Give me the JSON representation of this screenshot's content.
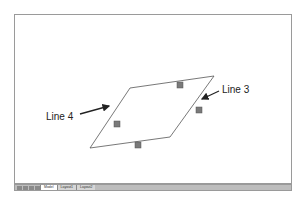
{
  "drawing": {
    "shape": "parallelogram",
    "vertices": [
      [
        130,
        88
      ],
      [
        214,
        76
      ],
      [
        170,
        137
      ],
      [
        90,
        148
      ]
    ],
    "grips": [
      [
        180,
        85
      ],
      [
        199,
        110
      ],
      [
        138,
        145
      ],
      [
        117,
        124
      ]
    ],
    "line_color": "#555555",
    "grip_color": "#777777"
  },
  "labels": {
    "line4": "Line 4",
    "line3": "Line 3"
  },
  "statusbar": {
    "tabs": [
      "Model",
      "Layout1",
      "Layout2"
    ],
    "active_tab": "Model"
  }
}
